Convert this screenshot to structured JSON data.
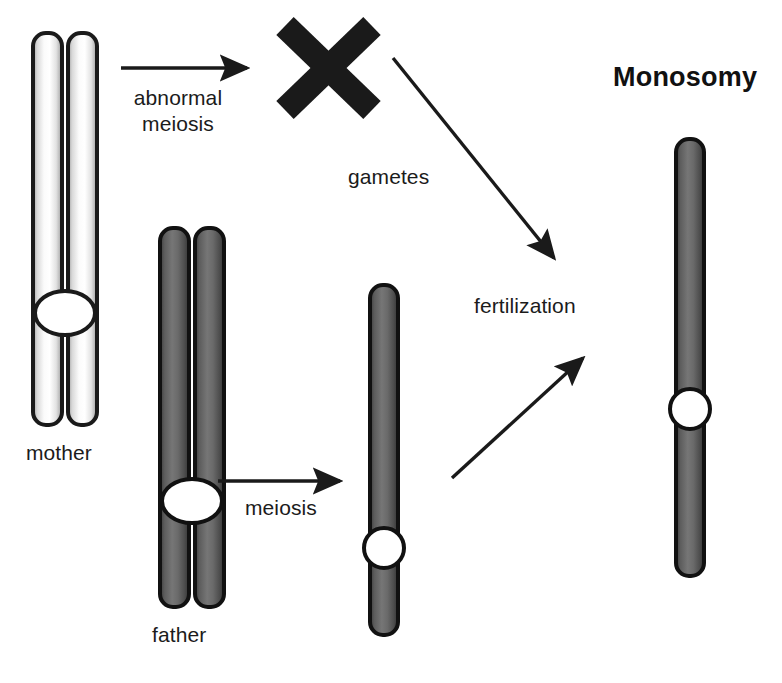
{
  "diagram": {
    "title": "Monosomy",
    "background_color": "#ffffff",
    "ink_color": "#1b1b1b",
    "labels": {
      "mother": "mother",
      "father": "father",
      "abnormal_meiosis_line1": "abnormal",
      "abnormal_meiosis_line2": "meiosis",
      "meiosis": "meiosis",
      "gametes": "gametes",
      "fertilization": "fertilization"
    },
    "chromosomes": {
      "mother": {
        "name": "mother-chromosome-pair",
        "chromatid_count": 2,
        "fill": "#f2f2f2",
        "outline": "#1a1a1a",
        "centromere_fill": "#ffffff",
        "centromere_shape": "ellipse"
      },
      "father": {
        "name": "father-chromosome-pair",
        "chromatid_count": 2,
        "fill": "#585858",
        "outline": "#111111",
        "centromere_fill": "#ffffff",
        "centromere_shape": "ellipse"
      },
      "paternal_gamete": {
        "name": "paternal-gamete-chromosome",
        "chromatid_count": 1,
        "fill": "#585858",
        "outline": "#111111",
        "centromere_fill": "#ffffff",
        "centromere_shape": "circle"
      },
      "monosomy_result": {
        "name": "monosomy-chromosome",
        "chromatid_count": 1,
        "fill": "#585858",
        "outline": "#111111",
        "centromere_fill": "#ffffff",
        "centromere_shape": "circle"
      }
    },
    "marks": {
      "missing_maternal_gamete": {
        "name": "x-cross-mark",
        "glyph": "X",
        "color": "#1a1a1a",
        "meaning": "no maternal chromosome in gamete"
      }
    },
    "arrows": [
      {
        "name": "arrow-abnormal-meiosis",
        "from": "mother",
        "to": "x-cross-mark",
        "direction": "right"
      },
      {
        "name": "arrow-meiosis",
        "from": "father",
        "to": "paternal-gamete",
        "direction": "right"
      },
      {
        "name": "arrow-maternal-fertilization",
        "from": "x-cross-mark",
        "to": "fertilization",
        "direction": "down-right"
      },
      {
        "name": "arrow-paternal-fertilization",
        "from": "paternal-gamete",
        "to": "fertilization",
        "direction": "up-right"
      }
    ]
  }
}
